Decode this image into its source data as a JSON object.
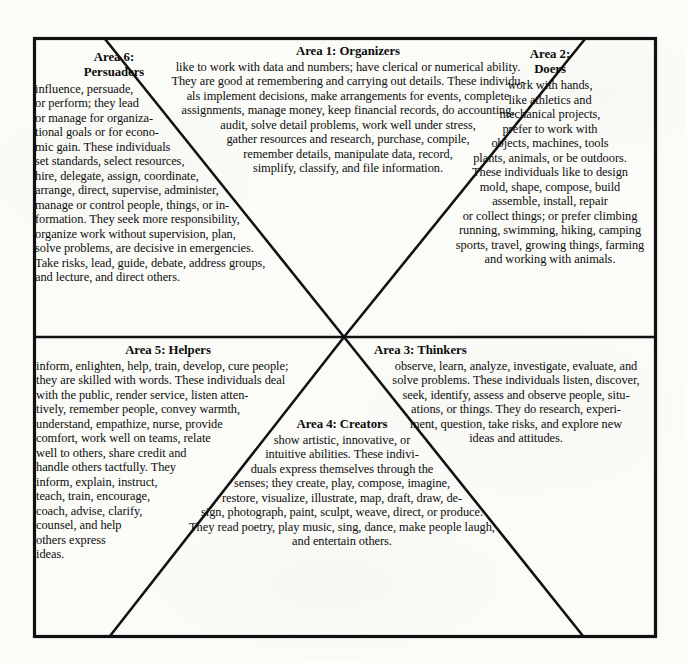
{
  "document": {
    "title": "Six Areas of Career Interest",
    "frame": {
      "border_color": "#111111",
      "background_color": "#fbfbf8"
    }
  },
  "areas": [
    {
      "id": "area-1",
      "number": "1",
      "name": "Organizers",
      "heading": "Area 1: Organizers",
      "body": "like to work with data and numbers;  have clerical or numerical ability.\nThey are good at remembering and carrying out details. These individu-\nals implement decisions, make arrangements for events, complete\nassignments, manage money, keep financial records, do accounting,\naudit, solve detail problems, work well under stress,\ngather resources and research, purchase, compile,\nremember details, manipulate data, record,\nsimplify, classify, and file information."
    },
    {
      "id": "area-2",
      "number": "2",
      "name": "Doers",
      "heading": "Area 2:\nDoers",
      "body": "work with hands,\nlike athletics and\nmechanical projects,\nprefer to work with\nobjects, machines, tools\nplants, animals, or be outdoors.\nThese individuals like to design\nmold, shape, compose, build\nassemble, install, repair\nor collect things; or prefer climbing\nrunning, swimming, hiking, camping\nsports, travel, growing things, farming\nand working with animals."
    },
    {
      "id": "area-3",
      "number": "3",
      "name": "Thinkers",
      "heading": "Area 3:  Thinkers",
      "body": "observe, learn, analyze, investigate, evaluate, and\nsolve problems. These individuals listen, discover,\nseek, identify, assess and observe people, situ-\nations, or things. They do research,  experi-\nment, question, take risks, and explore new\nideas and attitudes."
    },
    {
      "id": "area-4",
      "number": "4",
      "name": "Creators",
      "heading": "Area 4:  Creators",
      "body": "show artistic, innovative, or\nintuitive abilities. These indivi-\nduals express themselves through the\nsenses; they create, play, compose, imagine,\nrestore, visualize, illustrate, map, draft, draw, de-\nsign, photograph, paint, sculpt, weave, direct, or produce.\nThey read poetry, play music, sing, dance, make people laugh,\nand entertain others."
    },
    {
      "id": "area-5",
      "number": "5",
      "name": "Helpers",
      "heading": "Area 5:  Helpers",
      "body": "inform, enlighten, help, train, develop, cure people;\nthey are skilled with words. These individuals deal\nwith the public, render service, listen atten-\ntively, remember people,  convey warmth,\nunderstand, empathize,  nurse, provide\ncomfort, work well on teams, relate\nwell to others, share credit and\nhandle others tactfully. They\ninform, explain, instruct,\nteach, train, encourage,\ncoach, advise, clarify,\ncounsel, and help\nothers express\nideas."
    },
    {
      "id": "area-6",
      "number": "6",
      "name": "Persuaders",
      "heading": "Area 6:\nPersuaders",
      "body": "influence, persuade,\nor perform; they lead\nor manage for organiza-\ntional goals or for econo-\nmic gain.  These individuals\nset standards, select resources,\nhire, delegate, assign, coordinate,\narrange, direct, supervise, administer,\nmanage or control people, things, or in-\nformation. They seek more responsibility,\norganize work without supervision, plan,\nsolve problems, are decisive in emergencies.\nTake risks, lead, guide, debate,  address groups,\nand lecture, and direct others."
    }
  ]
}
